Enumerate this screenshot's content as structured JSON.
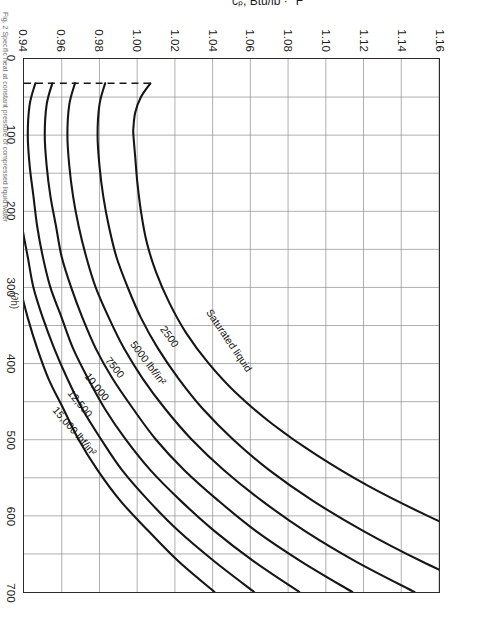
{
  "figure": {
    "caption": "Fig. 2  Specific heat at constant pressure of compressed liquid water",
    "partial_expression": "(∂h)"
  },
  "chart_data": {
    "type": "line",
    "title": "",
    "xlabel": "t, °F",
    "ylabel": "cₚ, Btu/lb · °F",
    "xlim": [
      0,
      700
    ],
    "ylim": [
      0.94,
      1.16
    ],
    "xticks": [
      "0",
      "100",
      "200",
      "300",
      "400",
      "500",
      "600",
      "700"
    ],
    "xtick_values": [
      0,
      100,
      200,
      300,
      400,
      500,
      600,
      700
    ],
    "yticks": [
      "0.94",
      "0.96",
      "0.98",
      "1.00",
      "1.02",
      "1.04",
      "1.06",
      "1.08",
      "1.10",
      "1.12",
      "1.14",
      "1.16"
    ],
    "ytick_values": [
      0.94,
      0.96,
      0.98,
      1.0,
      1.02,
      1.04,
      1.06,
      1.08,
      1.1,
      1.12,
      1.14,
      1.16
    ],
    "grid": true,
    "legend": "inline-curve-labels",
    "minor_x_divisions": 2,
    "series": [
      {
        "name": "Saturated liquid",
        "label": "Saturated liquid",
        "label_pos": {
          "x": 330,
          "y": 1.038,
          "angle": -34
        },
        "x": [
          32,
          50,
          70,
          90,
          100,
          130,
          160,
          200,
          240,
          280,
          320,
          360,
          400,
          440,
          480,
          520,
          560,
          600,
          640,
          680,
          700
        ],
        "y": [
          1.007,
          1.002,
          0.999,
          0.998,
          0.998,
          0.999,
          1.0,
          1.002,
          1.005,
          1.01,
          1.017,
          1.026,
          1.038,
          1.053,
          1.072,
          1.095,
          1.122,
          1.154,
          1.19,
          1.232,
          1.255
        ]
      },
      {
        "name": "2500 lbf/in2",
        "label": "2500",
        "label_pos": {
          "x": 352,
          "y": 1.014,
          "angle": -36
        },
        "x": [
          32,
          60,
          100,
          140,
          180,
          220,
          260,
          300,
          340,
          380,
          420,
          460,
          500,
          540,
          580,
          620,
          660,
          700
        ],
        "y": [
          0.983,
          0.98,
          0.979,
          0.98,
          0.982,
          0.985,
          0.989,
          0.995,
          1.002,
          1.011,
          1.022,
          1.035,
          1.051,
          1.07,
          1.093,
          1.12,
          1.151,
          1.186
        ]
      },
      {
        "name": "5000 lbf/in2",
        "label": "5000 lbf/in²",
        "label_pos": {
          "x": 372,
          "y": 0.998,
          "angle": -37
        },
        "x": [
          32,
          60,
          100,
          140,
          180,
          220,
          260,
          300,
          340,
          380,
          420,
          460,
          500,
          540,
          580,
          620,
          660,
          700
        ],
        "y": [
          0.967,
          0.964,
          0.963,
          0.964,
          0.966,
          0.969,
          0.973,
          0.978,
          0.985,
          0.993,
          1.003,
          1.015,
          1.029,
          1.046,
          1.066,
          1.089,
          1.116,
          1.147
        ]
      },
      {
        "name": "7500 lbf/in2",
        "label": "7500",
        "label_pos": {
          "x": 392,
          "y": 0.985,
          "angle": -38
        },
        "x": [
          32,
          60,
          100,
          140,
          180,
          220,
          260,
          300,
          340,
          380,
          420,
          460,
          500,
          540,
          580,
          620,
          660,
          700
        ],
        "y": [
          0.955,
          0.952,
          0.951,
          0.952,
          0.954,
          0.957,
          0.96,
          0.965,
          0.971,
          0.978,
          0.987,
          0.998,
          1.01,
          1.025,
          1.043,
          1.063,
          1.087,
          1.114
        ]
      },
      {
        "name": "10,000 lbf/in2",
        "label": "10,000",
        "label_pos": {
          "x": 414,
          "y": 0.974,
          "angle": -39
        },
        "x": [
          32,
          60,
          100,
          140,
          180,
          220,
          260,
          300,
          340,
          380,
          420,
          460,
          500,
          540,
          580,
          620,
          660,
          700
        ],
        "y": [
          0.946,
          0.943,
          0.942,
          0.943,
          0.945,
          0.947,
          0.95,
          0.954,
          0.96,
          0.966,
          0.974,
          0.983,
          0.994,
          1.007,
          1.023,
          1.041,
          1.062,
          1.086
        ]
      },
      {
        "name": "12,500 lbf/in2",
        "label": "12,500",
        "label_pos": {
          "x": 436,
          "y": 0.965,
          "angle": -40
        },
        "x": [
          32,
          60,
          100,
          140,
          180,
          220,
          260,
          300,
          340,
          380,
          420,
          460,
          500,
          540,
          580,
          620,
          660,
          700
        ],
        "y": [
          0.938,
          0.936,
          0.935,
          0.936,
          0.937,
          0.939,
          0.942,
          0.945,
          0.95,
          0.956,
          0.963,
          0.971,
          0.981,
          0.992,
          1.006,
          1.022,
          1.041,
          1.062
        ]
      },
      {
        "name": "15,000 lbf/in2",
        "label": "15,000 lbf/in²",
        "label_pos": {
          "x": 458,
          "y": 0.957,
          "angle": -41
        },
        "x": [
          32,
          60,
          100,
          140,
          180,
          220,
          260,
          300,
          340,
          380,
          420,
          460,
          500,
          540,
          580,
          620,
          660,
          700
        ],
        "y": [
          0.932,
          0.93,
          0.929,
          0.929,
          0.931,
          0.933,
          0.935,
          0.938,
          0.942,
          0.947,
          0.953,
          0.961,
          0.969,
          0.979,
          0.991,
          1.006,
          1.022,
          1.041
        ]
      }
    ],
    "saturation_line": {
      "name": "saturation boundary",
      "style": "dashed",
      "x": [
        32,
        32
      ],
      "note": "dashed line joining the low-temperature ends of all constant-pressure curves"
    }
  }
}
